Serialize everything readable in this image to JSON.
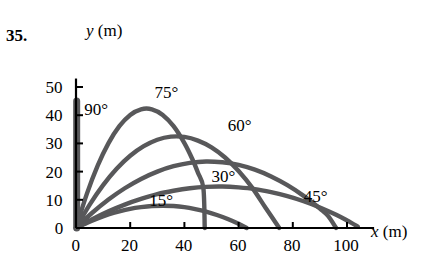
{
  "figure": {
    "problem_number": "35.",
    "y_axis_label_var": "y",
    "y_axis_label_unit": "(m)",
    "x_axis_label_var": "x",
    "x_axis_label_unit": "(m)",
    "curve_color": "#58585a",
    "axis_color": "#000000"
  },
  "chart_data": {
    "type": "line",
    "title": "",
    "xlabel": "x (m)",
    "ylabel": "y (m)",
    "xlim": [
      0,
      105
    ],
    "ylim": [
      0,
      52
    ],
    "xticks": [
      0,
      20,
      40,
      60,
      80,
      100
    ],
    "xtick_labels": [
      "0",
      "20",
      "40",
      "60",
      "80",
      "100"
    ],
    "yticks": [
      0,
      10,
      20,
      30,
      40,
      50
    ],
    "ytick_labels": [
      "0",
      "10",
      "20",
      "30",
      "40",
      "50"
    ],
    "grid": false,
    "legend": "inline-annotations",
    "series": [
      {
        "name": "90°",
        "annotation": "90°",
        "annotation_xy": [
          3,
          42
        ],
        "range_m": 0,
        "peak_height_m": 45,
        "peak_x_m": 0,
        "points": [
          [
            0,
            0
          ],
          [
            0,
            45
          ],
          [
            0.6,
            45
          ],
          [
            0.6,
            0
          ]
        ]
      },
      {
        "name": "75°",
        "annotation": "75°",
        "annotation_xy": [
          29,
          48
        ],
        "range_m": 47,
        "peak_height_m": 43,
        "peak_x_m": 24,
        "points": [
          [
            0,
            0
          ],
          [
            4,
            12.1
          ],
          [
            8,
            22.1
          ],
          [
            12,
            30.1
          ],
          [
            16,
            36.1
          ],
          [
            20,
            40.1
          ],
          [
            24,
            42.1
          ],
          [
            28,
            42.1
          ],
          [
            32,
            40.1
          ],
          [
            36,
            36.1
          ],
          [
            40,
            30.1
          ],
          [
            43,
            24.3
          ],
          [
            45,
            19.6
          ],
          [
            47,
            14.2
          ],
          [
            47.5,
            0
          ]
        ]
      },
      {
        "name": "60°",
        "annotation": "60°",
        "annotation_xy": [
          56,
          36
        ],
        "range_m": 80,
        "peak_height_m": 35,
        "peak_x_m": 40,
        "points": [
          [
            0,
            0
          ],
          [
            5,
            8.2
          ],
          [
            10,
            15.2
          ],
          [
            15,
            21.0
          ],
          [
            20,
            25.6
          ],
          [
            25,
            29.0
          ],
          [
            30,
            31.3
          ],
          [
            35,
            32.4
          ],
          [
            40,
            32.3
          ],
          [
            45,
            31.0
          ],
          [
            50,
            28.6
          ],
          [
            55,
            25.0
          ],
          [
            60,
            20.2
          ],
          [
            65,
            14.3
          ],
          [
            70,
            7.1
          ],
          [
            75,
            0
          ]
        ]
      },
      {
        "name": "45°",
        "annotation": "45°",
        "annotation_xy": [
          84,
          11
        ],
        "range_m": 93,
        "peak_height_m": 25,
        "peak_x_m": 47,
        "points": [
          [
            0,
            0
          ],
          [
            6,
            5.4
          ],
          [
            12,
            10.1
          ],
          [
            18,
            14.1
          ],
          [
            24,
            17.4
          ],
          [
            30,
            20.0
          ],
          [
            36,
            21.9
          ],
          [
            42,
            23.1
          ],
          [
            48,
            23.6
          ],
          [
            54,
            23.3
          ],
          [
            60,
            22.4
          ],
          [
            66,
            20.7
          ],
          [
            72,
            18.3
          ],
          [
            78,
            15.2
          ],
          [
            84,
            11.4
          ],
          [
            90,
            6.9
          ],
          [
            93,
            4.3
          ],
          [
            96,
            0
          ]
        ]
      },
      {
        "name": "30°",
        "annotation": "30°",
        "annotation_xy": [
          50,
          18
        ],
        "range_m": 80,
        "peak_height_m": 15,
        "peak_x_m": 40,
        "points": [
          [
            0,
            0
          ],
          [
            6,
            3.1
          ],
          [
            12,
            5.9
          ],
          [
            18,
            8.3
          ],
          [
            24,
            10.3
          ],
          [
            30,
            12.0
          ],
          [
            36,
            13.2
          ],
          [
            42,
            14.1
          ],
          [
            48,
            14.6
          ],
          [
            54,
            14.7
          ],
          [
            60,
            14.4
          ],
          [
            66,
            13.8
          ],
          [
            72,
            12.7
          ],
          [
            78,
            11.3
          ],
          [
            84,
            9.5
          ],
          [
            90,
            7.3
          ],
          [
            96,
            4.7
          ],
          [
            100,
            2.7
          ],
          [
            104,
            0.5
          ]
        ]
      },
      {
        "name": "15°",
        "annotation": "15°",
        "annotation_xy": [
          27,
          9.5
        ],
        "range_m": 47,
        "peak_height_m": 8,
        "peak_x_m": 24,
        "points": [
          [
            0,
            0
          ],
          [
            4,
            1.8
          ],
          [
            8,
            3.4
          ],
          [
            12,
            4.8
          ],
          [
            16,
            5.9
          ],
          [
            20,
            6.8
          ],
          [
            24,
            7.4
          ],
          [
            28,
            7.8
          ],
          [
            32,
            7.9
          ],
          [
            36,
            7.8
          ],
          [
            40,
            7.4
          ],
          [
            44,
            6.7
          ],
          [
            48,
            5.8
          ],
          [
            52,
            4.6
          ],
          [
            56,
            3.2
          ],
          [
            60,
            1.5
          ],
          [
            63,
            0
          ]
        ]
      }
    ]
  }
}
